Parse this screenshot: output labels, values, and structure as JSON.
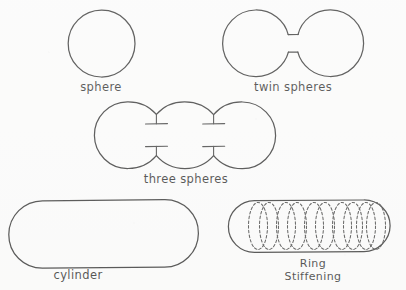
{
  "page": {
    "background_color": "#fdfdfd",
    "ink_color": "#262626",
    "width": 406,
    "height": 290
  },
  "figures": [
    {
      "id": "sphere",
      "label": "sphere",
      "shape": "circle",
      "label_x": 101,
      "label_y": 91,
      "geometry": {
        "cx": 101.5,
        "cy": 43.5,
        "r": 33.5
      }
    },
    {
      "id": "twin-spheres",
      "label": "twin spheres",
      "shape": "two-circles-with-neck",
      "label_x": 293,
      "label_y": 91,
      "geometry": {
        "left": {
          "cx": 256,
          "cy": 43,
          "r": 33.5
        },
        "right": {
          "cx": 330,
          "cy": 43,
          "r": 33.5
        },
        "neck": {
          "x1": 288,
          "x2": 298,
          "y_top": 35,
          "y_bottom": 52
        }
      }
    },
    {
      "id": "three-spheres",
      "label": "three  spheres",
      "shape": "three-overlapping-circles",
      "label_x": 186,
      "label_y": 183,
      "geometry": {
        "circles": [
          {
            "cx": 126,
            "cy": 139,
            "r": 33.5
          },
          {
            "cx": 186,
            "cy": 139,
            "r": 33.5
          },
          {
            "cx": 246,
            "cy": 139,
            "r": 33.5
          }
        ],
        "stiffener_bars": [
          {
            "x": 156,
            "y": 128,
            "w": 22,
            "stem": "up"
          },
          {
            "x": 156,
            "y": 151,
            "w": 22,
            "stem": "down"
          },
          {
            "x": 216,
            "y": 128,
            "w": 22,
            "stem": "up"
          },
          {
            "x": 216,
            "y": 151,
            "w": 22,
            "stem": "down"
          }
        ]
      }
    },
    {
      "id": "cylinder",
      "label": "cylinder",
      "shape": "stadium",
      "label_x": 78,
      "label_y": 279,
      "geometry": {
        "x": 8,
        "y": 200,
        "w": 190,
        "h": 68,
        "r": 34
      }
    },
    {
      "id": "ring-stiffening",
      "label_line1": "Ring",
      "label_line2": "Stiffening",
      "shape": "stadium-with-rings",
      "label_x": 313,
      "label_y": 267,
      "label_y2": 280,
      "geometry": {
        "x": 228,
        "y": 200,
        "w": 162,
        "h": 52,
        "r": 26
      },
      "ring_count": 5,
      "ring_style": "dashed-ellipse-pair",
      "ring_centers": [
        262,
        290,
        318,
        346,
        371
      ],
      "ring_rx": 9,
      "ring_ry": 24
    }
  ],
  "legend_labels": [
    "sphere",
    "twin spheres",
    "three  spheres",
    "cylinder",
    "Ring",
    "Stiffening"
  ]
}
